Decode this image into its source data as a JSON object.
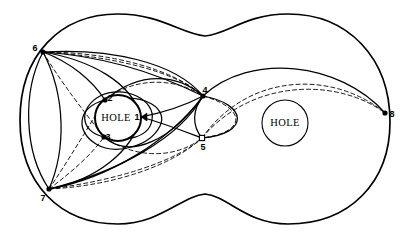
{
  "figure": {
    "name": "double-torus-curve-diagram",
    "background_color": "#ffffff",
    "stroke_color": "#000000",
    "width": 410,
    "height": 238
  },
  "holes": [
    {
      "id": "left-hole",
      "label": "HOLE",
      "cx": 118,
      "cy": 118,
      "r": 23,
      "label_x": 116,
      "label_y": 121
    },
    {
      "id": "right-hole",
      "label": "HOLE",
      "cx": 285,
      "cy": 123,
      "r": 23,
      "label_x": 285,
      "label_y": 126
    }
  ],
  "vertices": [
    {
      "id": "v1",
      "label": "1",
      "x": 141,
      "y": 117,
      "label_x": 137,
      "label_y": 120,
      "marker": "arrowhead"
    },
    {
      "id": "v2",
      "label": "2",
      "x": 105,
      "y": 100,
      "label_x": 110,
      "label_y": 101,
      "marker": "dot"
    },
    {
      "id": "v3",
      "label": "3",
      "x": 104,
      "y": 137,
      "label_x": 108,
      "label_y": 140,
      "marker": "dot"
    },
    {
      "id": "v4",
      "label": "4",
      "x": 203,
      "y": 96,
      "label_x": 205,
      "label_y": 93,
      "marker": "dot"
    },
    {
      "id": "v5",
      "label": "5",
      "x": 202,
      "y": 138,
      "label_x": 203,
      "label_y": 150,
      "marker": "square"
    },
    {
      "id": "v6",
      "label": "6",
      "x": 43,
      "y": 52,
      "label_x": 35,
      "label_y": 51,
      "marker": "dot"
    },
    {
      "id": "v7",
      "label": "7",
      "x": 49,
      "y": 189,
      "label_x": 43,
      "label_y": 201,
      "marker": "dot"
    },
    {
      "id": "v8",
      "label": "8",
      "x": 385,
      "y": 113,
      "label_x": 392,
      "label_y": 117,
      "marker": "dot"
    }
  ],
  "outline": {
    "id": "peanut-boundary",
    "description": "two-lobe peanut shaped outer boundary",
    "path": "M 20 120 C 20 55 60 14 118 14 C 160 14 182 34 205 36 C 228 34 246 14 288 14 C 348 14 390 58 390 122 C 390 182 350 224 288 224 C 246 224 228 196 205 194 C 182 196 160 224 118 224 C 60 224 20 184 20 120 Z"
  },
  "curves": [
    {
      "id": "c-6-4-outer-solid",
      "style": "solid",
      "path": "M 43 52 C 100 56 150 70 203 96"
    },
    {
      "id": "c-6-4-upper-solid",
      "style": "solid",
      "path": "M 43 52 C 110 48 175 62 203 96"
    },
    {
      "id": "c-6-4-dashed-a",
      "style": "dashed",
      "path": "M 43 52 C 108 52 172 68 203 96"
    },
    {
      "id": "c-6-4-dashed-b",
      "style": "dashed",
      "path": "M 43 52 C 112 56 178 72 203 96"
    },
    {
      "id": "c-6-2-solid",
      "style": "solid",
      "path": "M 43 52 C 70 62 92 80 105 100"
    },
    {
      "id": "c-6-1-solid",
      "style": "solid",
      "path": "M 43 52 C 90 60 132 82 141 117"
    },
    {
      "id": "c-6-3-dashed",
      "style": "dashed",
      "path": "M 43 52 C 62 84 86 114 104 137"
    },
    {
      "id": "c-6-7-left-solid",
      "style": "solid",
      "path": "M 43 52 C 22 92 24 152 49 189"
    },
    {
      "id": "c-6-7-inner-solid",
      "style": "solid",
      "path": "M 43 52 C 66 96 66 150 49 189"
    },
    {
      "id": "c-7-4-solid-a",
      "style": "solid",
      "path": "M 49 189 C 110 178 170 140 203 96"
    },
    {
      "id": "c-7-4-solid-b",
      "style": "solid",
      "path": "M 49 189 C 118 172 180 138 203 96"
    },
    {
      "id": "c-7-5-dashed-a",
      "style": "dashed",
      "path": "M 49 189 C 112 186 172 166 202 138"
    },
    {
      "id": "c-7-5-dashed-b",
      "style": "dashed",
      "path": "M 49 189 C 120 180 178 160 202 138"
    },
    {
      "id": "c-7-2-dashed",
      "style": "dashed",
      "path": "M 49 189 C 70 158 90 124 105 100"
    },
    {
      "id": "c-7-3-dashed",
      "style": "dashed",
      "path": "M 49 189 C 72 172 92 154 104 137"
    },
    {
      "id": "c-7-1-solid",
      "style": "solid",
      "path": "M 49 189 C 96 180 132 152 141 117"
    },
    {
      "id": "c-hole-ring-outer",
      "style": "solid",
      "path": "M 105 100 C 148 92 168 110 160 126 C 150 146 116 156 96 144 C 76 132 76 108 105 100 Z"
    },
    {
      "id": "c-hole-ring-inner",
      "style": "solid",
      "path": "M 104 137 C 80 132 78 108 100 96 C 124 84 156 100 152 120 C 149 138 126 142 104 137 Z"
    },
    {
      "id": "c-2-4-solid",
      "style": "solid",
      "path": "M 105 100 C 140 70 178 74 203 96"
    },
    {
      "id": "c-2-4-dashed",
      "style": "dashed",
      "path": "M 105 100 C 138 74 180 80 203 96"
    },
    {
      "id": "c-3-4-solid",
      "style": "solid",
      "path": "M 104 137 C 130 160 172 140 203 96"
    },
    {
      "id": "c-3-5-dashed",
      "style": "dashed",
      "path": "M 104 137 C 140 162 180 156 202 138"
    },
    {
      "id": "c-1-4-solid",
      "style": "solid",
      "path": "M 141 117 C 166 112 188 104 203 96"
    },
    {
      "id": "c-1-5-solid",
      "style": "solid",
      "path": "M 141 117 C 166 124 186 132 202 138"
    },
    {
      "id": "c-4-5-left-solid",
      "style": "solid",
      "path": "M 203 96 C 192 110 192 126 202 138"
    },
    {
      "id": "c-4-5-bulge-solid",
      "style": "solid",
      "path": "M 203 96 C 248 104 250 134 202 138"
    },
    {
      "id": "c-4-5-bulge-dashed",
      "style": "dashed",
      "path": "M 203 96 C 246 108 248 132 202 138"
    },
    {
      "id": "c-4-8-solid",
      "style": "solid",
      "path": "M 203 96 C 250 52 340 62 385 113"
    },
    {
      "id": "c-5-8-dashed",
      "style": "dashed",
      "path": "M 202 138 C 250 70 336 72 385 113"
    },
    {
      "id": "c-5-8-dashed-low",
      "style": "dashed",
      "path": "M 202 138 C 252 78 338 78 385 113"
    }
  ]
}
